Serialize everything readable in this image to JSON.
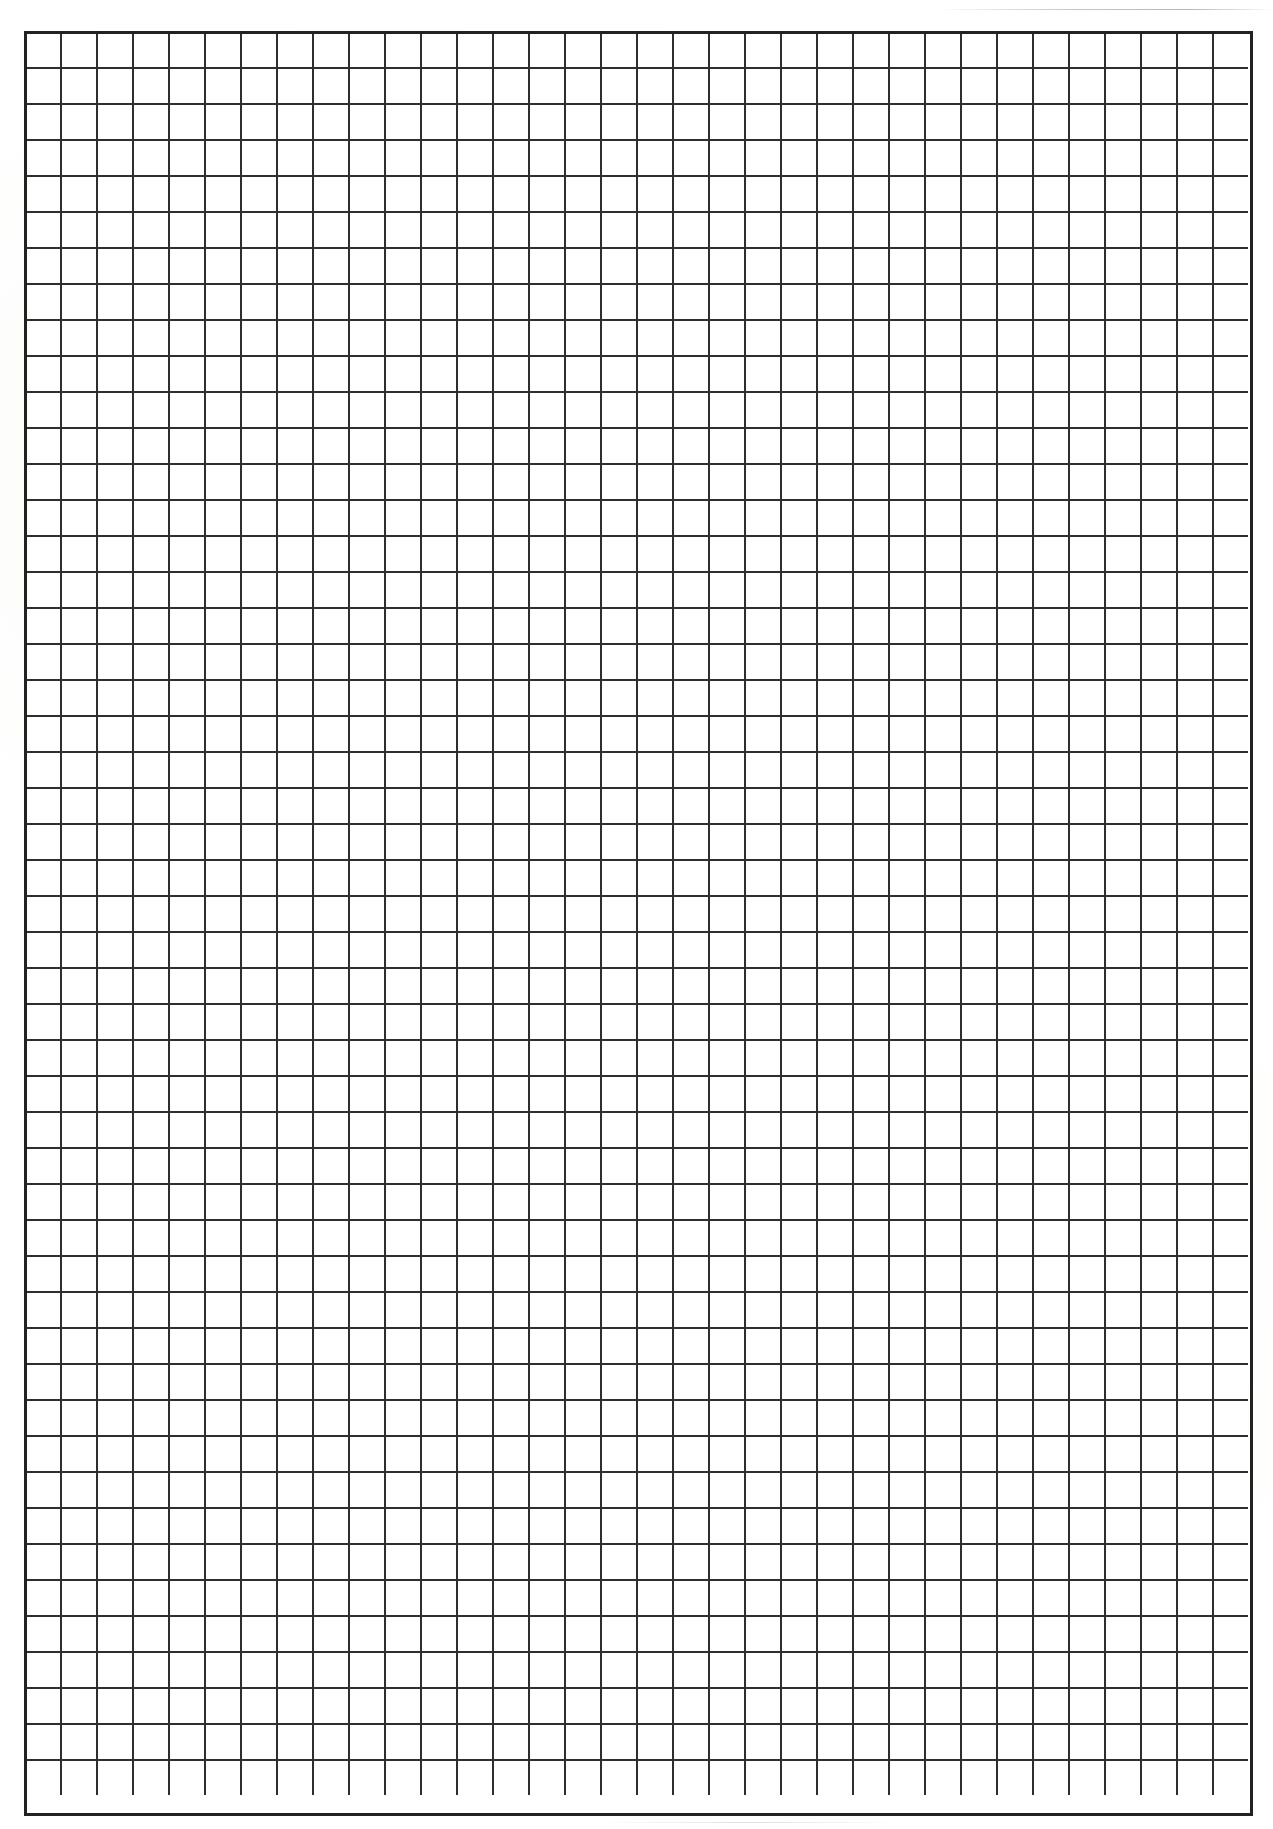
{
  "document": {
    "kind": "scanned-grid-paper",
    "title": "Blank grid paper",
    "page_label": "",
    "text_content": "",
    "annotations": []
  },
  "page": {
    "width": 1273,
    "height": 1829,
    "background_color": "#ffffff"
  },
  "grid": {
    "left": 24,
    "top": 31,
    "width": 1229,
    "height": 1785,
    "cell_size": 36,
    "columns": 34,
    "rows": 49,
    "line_color": "#2e2e2e",
    "border_color": "#222222",
    "line_width": 1.6,
    "border_width": 3,
    "cell_fill": "#ffffff"
  },
  "artifacts": {
    "top_streak_label": "scanner streak",
    "bottom_streak_label": "scanner streak"
  }
}
